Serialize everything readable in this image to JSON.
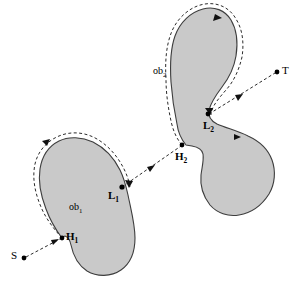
{
  "figure": {
    "background_color": "#ffffff",
    "obstacle_fill_color": "#c9c9c9",
    "obstacle_stroke_color": "#3d3d3d",
    "line_color": "#2b2b2b",
    "width": 301,
    "height": 291
  },
  "labels": {
    "start": "S",
    "target": "T",
    "obstacle_1": {
      "base": "ob",
      "sub": "1"
    },
    "obstacle_2": {
      "base": "ob",
      "sub": "2"
    },
    "hit_point_1": {
      "base": "H",
      "sub": "1"
    },
    "hit_point_2": {
      "base": "H",
      "sub": "2"
    },
    "leave_point_1": {
      "base": "L",
      "sub": "1"
    },
    "leave_point_2": {
      "base": "L",
      "sub": "2"
    }
  },
  "points": {
    "S": {
      "x": 24,
      "y": 258
    },
    "H1": {
      "x": 62,
      "y": 238
    },
    "L1": {
      "x": 122,
      "y": 187
    },
    "H2": {
      "x": 182,
      "y": 145
    },
    "L2": {
      "x": 208,
      "y": 114
    },
    "T": {
      "x": 277,
      "y": 72
    }
  },
  "segments": [
    {
      "name": "S-to-H1",
      "from": "S",
      "to": "H1",
      "style": "dashed",
      "arrow": true
    },
    {
      "name": "contour-obstacle-1",
      "from": "H1",
      "to": "L1",
      "style": "dashed",
      "arrow": true
    },
    {
      "name": "L1-to-H2",
      "from": "L1",
      "to": "H2",
      "style": "dashed",
      "arrow": true
    },
    {
      "name": "contour-obstacle-2",
      "from": "H2",
      "to": "L2",
      "style": "dashed",
      "arrow": true
    },
    {
      "name": "L2-to-T",
      "from": "L2",
      "to": "T",
      "style": "dashed",
      "arrow": true
    }
  ]
}
